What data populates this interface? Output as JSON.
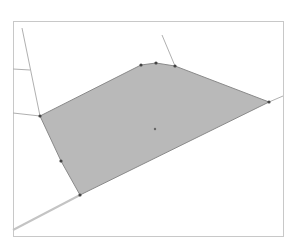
{
  "diagram": {
    "type": "geometry-region",
    "frame": {
      "x": 13,
      "y": 21,
      "width": 270,
      "height": 215,
      "stroke": "#c8c8c8"
    },
    "region": {
      "fill": "#b9b9b9",
      "stroke": "#8a8a8a",
      "vertices": [
        [
          40,
          116
        ],
        [
          141,
          65
        ],
        [
          156,
          63
        ],
        [
          175,
          66
        ],
        [
          269,
          102
        ],
        [
          80,
          195
        ],
        [
          61,
          161
        ]
      ]
    },
    "vertex_color": "#444444",
    "centroid_marker": [
      155,
      129
    ],
    "construction_lines": [
      {
        "from": [
          22,
          28
        ],
        "to": [
          40,
          116
        ],
        "color": "#b0b0b0"
      },
      {
        "from": [
          13,
          113
        ],
        "to": [
          40,
          116
        ],
        "color": "#b0b0b0"
      },
      {
        "from": [
          162,
          35
        ],
        "to": [
          175,
          66
        ],
        "color": "#b0b0b0"
      },
      {
        "from": [
          269,
          102
        ],
        "to": [
          283,
          96
        ],
        "color": "#b0b0b0"
      },
      {
        "from": [
          13,
          230
        ],
        "to": [
          80,
          195
        ],
        "color": "#c4c4c4",
        "width": 2
      },
      {
        "from": [
          13,
          69
        ],
        "to": [
          30,
          70
        ],
        "color": "#b0b0b0"
      }
    ]
  }
}
